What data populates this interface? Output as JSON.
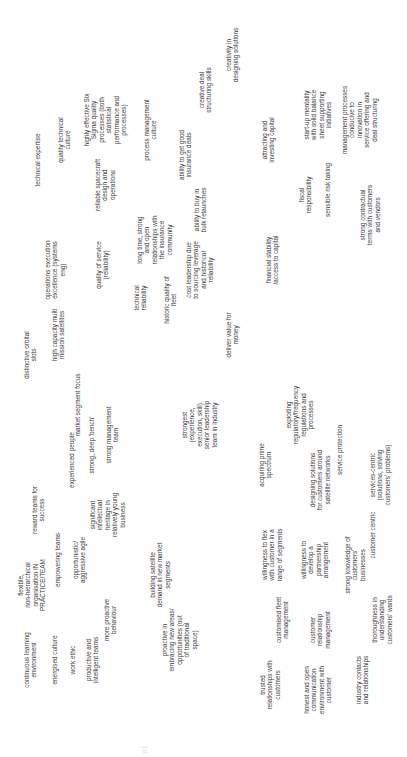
{
  "diagram": {
    "orientation": "rotated -90deg (text reads bottom-to-top)",
    "clusters": {
      "culture_people": [
        "continuous learning\nenvironment",
        "energised culture",
        "work ethic",
        "productive and\nintelligent teams",
        "flexible,\nnon-hierarchical\norganisation IN\nPRACTICE/TEAM",
        "empowering teams",
        "opportunistic/\naggressive agile",
        "more proactive\nbehaviour",
        "reward teams for\nsuccess",
        "significant\nintellectual\nheritage in\nrelatively young\nbusiness",
        "experienced people",
        "strong, deep 'bench'",
        "strong management\nteam",
        "market segment focus",
        "strongest\n(experience,\nexecution, skill)\nsenior leadership\nteam in industry",
        "building satellite\ndemand in new market\nsegments",
        "proactive in\nembracing new areas/\nopportunities (out\nof traditional\nspace)"
      ],
      "customers": [
        "trusted\nrelationships with\ncustomers",
        "honest and open\ncommunication\nenvironment with\ncustomer",
        "industry contacts\nand relationships",
        "customised fleet\nmanagement",
        "customer\nrelationship\nmanagement",
        "thoroughness in\nunderstanding\ncustomers' wants",
        "willingness to flex\nwith customer in a\nrange of segments",
        "willingness to\ndevelop a\npartnership\narrangement",
        "strong knowledge of\ncustomers'\nbusinesses",
        "customer centric",
        "designing solutions\nfor customers around\nsatellite networks",
        "services-centric\n(solutions, solving\ncustomers' problems)",
        "acquiring prime\nspectrum",
        "exploiting\nregulatory/frequency\nregulations and\nprocesses",
        "service protection"
      ],
      "operations": [
        "distinctive orbital\nslots",
        "high capacity multi\nmission satellites",
        "operations execution\nexcellence (systems\neng)",
        "quality of service\n(reliability)",
        "technical\nreliability",
        "historic quality of\nfleet",
        "cost leadership due\nto sourcing leverage\nand historical\nreliability",
        "long time, strong\nand open\nrelationships with\nthe insurance\ncommunity",
        "ability to buy in\nbulk relaunches",
        "ability to get good\ninsurance deals",
        "deliver value for\nmoney"
      ],
      "technical": [
        "technical expertise",
        "quality technical\nculture",
        "reliable spacecraft\ndesign and\noperations",
        "highly effective Six\nSigma quality\nprocesses (both\nstatistical\nperformance and\nprocesses)",
        "process management\nculture",
        "creative deal\nstructuring skills",
        "creativity in\ndesigning solutions"
      ],
      "finance": [
        "attracting and\ninvesting capital",
        "financial stability\n/access to capital",
        "fiscal\nresponsibility",
        "start-up mentality\nwith solid balance\nsheet supporting\ninitiatives",
        "sensible risk taking",
        "management processes\nconducive to\ninnovation in\nservice offering and\ndeal structuring",
        "strong contractual\nterms with customers\nand vendors"
      ]
    },
    "page_number": "81"
  }
}
